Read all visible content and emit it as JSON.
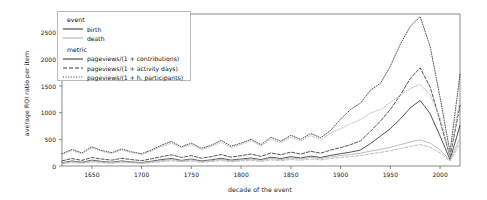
{
  "chart_data": {
    "type": "line",
    "title": "",
    "xlabel": "decade of the event",
    "ylabel": "average ROI ratio per item",
    "xlim": [
      1620,
      2020
    ],
    "ylim": [
      0,
      2850
    ],
    "xticks": [
      1650,
      1700,
      1750,
      1800,
      1850,
      1900,
      1950,
      2000
    ],
    "yticks": [
      0,
      500,
      1000,
      1500,
      2000,
      2500
    ],
    "grid": false,
    "legend_position": "upper left",
    "legend_groups": [
      {
        "title": "event",
        "entries": [
          {
            "label": "birth",
            "color": "#3f3f3f",
            "dash": "solid"
          },
          {
            "label": "death",
            "color": "#b4b4b4",
            "dash": "solid"
          }
        ]
      },
      {
        "title": "metric",
        "entries": [
          {
            "label": "pageviews/(1 + contributions)",
            "color": "#3f3f3f",
            "dash": "solid"
          },
          {
            "label": "pageviews/(1 + activity days)",
            "color": "#3f3f3f",
            "dash": "dashed"
          },
          {
            "label": "pageviews/(1 + h. participants)",
            "color": "#3f3f3f",
            "dash": "dotted"
          }
        ]
      }
    ],
    "x": [
      1620,
      1630,
      1640,
      1650,
      1660,
      1670,
      1680,
      1690,
      1700,
      1710,
      1720,
      1730,
      1740,
      1750,
      1760,
      1770,
      1780,
      1790,
      1800,
      1810,
      1820,
      1830,
      1840,
      1850,
      1860,
      1870,
      1880,
      1890,
      1900,
      1910,
      1920,
      1930,
      1940,
      1950,
      1960,
      1970,
      1980,
      1990,
      2000,
      2010,
      2020
    ],
    "series": [
      {
        "name": "birth / pageviews/(1 + contributions)",
        "event": "birth",
        "metric": "pageviews/(1 + contributions)",
        "color": "#3f3f3f",
        "dash": "solid",
        "values": [
          60,
          95,
          70,
          110,
          85,
          70,
          95,
          75,
          65,
          90,
          120,
          140,
          105,
          130,
          95,
          115,
          145,
          110,
          130,
          150,
          120,
          165,
          140,
          175,
          150,
          185,
          160,
          200,
          230,
          260,
          300,
          420,
          560,
          700,
          880,
          1090,
          1230,
          980,
          560,
          120,
          760
        ]
      },
      {
        "name": "birth / pageviews/(1 + activity days)",
        "event": "birth",
        "metric": "pageviews/(1 + activity days)",
        "color": "#3f3f3f",
        "dash": "dashed",
        "values": [
          95,
          140,
          105,
          160,
          130,
          110,
          145,
          120,
          100,
          135,
          175,
          210,
          160,
          195,
          145,
          175,
          215,
          165,
          195,
          225,
          180,
          245,
          210,
          260,
          225,
          275,
          240,
          300,
          345,
          400,
          470,
          650,
          840,
          1060,
          1330,
          1640,
          1840,
          1480,
          840,
          175,
          1140
        ]
      },
      {
        "name": "birth / pageviews/(1 + h. participants)",
        "event": "birth",
        "metric": "pageviews/(1 + h. participants)",
        "color": "#3f3f3f",
        "dash": "dotted",
        "values": [
          230,
          310,
          245,
          360,
          290,
          250,
          320,
          265,
          230,
          300,
          390,
          460,
          360,
          430,
          330,
          390,
          480,
          370,
          430,
          500,
          400,
          540,
          465,
          575,
          500,
          610,
          530,
          665,
          880,
          1060,
          1180,
          1420,
          1550,
          1870,
          2280,
          2620,
          2800,
          2240,
          1280,
          260,
          1720
        ]
      },
      {
        "name": "death / pageviews/(1 + contributions)",
        "event": "death",
        "metric": "pageviews/(1 + contributions)",
        "color": "#b4b4b4",
        "dash": "solid",
        "values": [
          55,
          80,
          65,
          95,
          75,
          65,
          85,
          70,
          60,
          80,
          100,
          120,
          95,
          115,
          85,
          100,
          125,
          95,
          115,
          130,
          105,
          140,
          120,
          150,
          130,
          160,
          140,
          170,
          195,
          215,
          240,
          280,
          310,
          350,
          400,
          450,
          490,
          430,
          300,
          110,
          520
        ]
      },
      {
        "name": "death / pageviews/(1 + activity days)",
        "event": "death",
        "metric": "pageviews/(1 + activity days)",
        "color": "#b4b4b4",
        "dash": "dashed",
        "values": [
          45,
          65,
          52,
          78,
          62,
          53,
          70,
          58,
          48,
          65,
          82,
          98,
          78,
          94,
          70,
          82,
          102,
          78,
          94,
          107,
          86,
          115,
          98,
          122,
          107,
          131,
          115,
          140,
          160,
          176,
          196,
          229,
          254,
          287,
          327,
          368,
          400,
          352,
          245,
          90,
          425
        ]
      },
      {
        "name": "death / pageviews/(1 + h. participants)",
        "event": "death",
        "metric": "pageviews/(1 + h. participants)",
        "color": "#b4b4b4",
        "dash": "dotted",
        "values": [
          215,
          290,
          230,
          340,
          275,
          235,
          300,
          250,
          215,
          280,
          365,
          430,
          340,
          405,
          310,
          365,
          450,
          345,
          405,
          470,
          375,
          505,
          435,
          540,
          470,
          570,
          495,
          620,
          700,
          790,
          870,
          990,
          1060,
          1190,
          1330,
          1450,
          1530,
          1330,
          900,
          200,
          1250
        ]
      }
    ]
  },
  "axes": {
    "ylabel": "average ROI ratio per item",
    "xlabel": "decade of the event",
    "yticks": [
      "0",
      "500",
      "1000",
      "1500",
      "2000",
      "2500"
    ],
    "xticks": [
      "1650",
      "1700",
      "1750",
      "1800",
      "1850",
      "1900",
      "1950",
      "2000"
    ]
  },
  "legend": {
    "event_title": "event",
    "metric_title": "metric",
    "birth": "birth",
    "death": "death",
    "metric_contributions": "pageviews/(1 + contributions)",
    "metric_activity_days": "pageviews/(1 + activity days)",
    "metric_participants": "pageviews/(1 + h. participants)"
  }
}
